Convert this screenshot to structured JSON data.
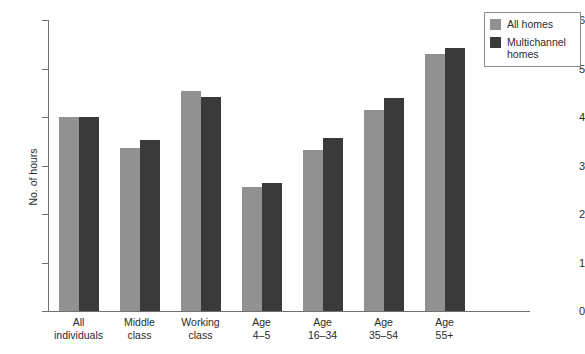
{
  "chart_data": {
    "type": "bar",
    "title": "",
    "subtitle": "",
    "xlabel": "",
    "ylabel": "No. of hours",
    "ylim": [
      0,
      6
    ],
    "yticks": [
      "0",
      "1",
      "2",
      "3",
      "4",
      "5",
      "6"
    ],
    "grid": false,
    "legend_position": "top-right",
    "categories": [
      "All\nindividuals",
      "Middle\nclass",
      "Working\nclass",
      "Age\n4–5",
      "Age\n16–34",
      "Age\n35–54",
      "Age\n55+"
    ],
    "series": [
      {
        "name": "All homes",
        "color": "#919191",
        "values": [
          4.0,
          3.36,
          4.53,
          2.56,
          3.32,
          4.14,
          5.3
        ]
      },
      {
        "name": "Multichannel homes",
        "color": "#3a3a3a",
        "values": [
          4.0,
          3.53,
          4.41,
          2.64,
          3.57,
          4.39,
          5.42
        ]
      }
    ]
  },
  "legend": {
    "items": [
      {
        "label": "All homes",
        "color": "#919191"
      },
      {
        "label": "Multichannel homes",
        "color": "#3a3a3a"
      }
    ]
  },
  "axis": {
    "y_title": "No. of hours",
    "axis_color": "#6f6f6f"
  }
}
